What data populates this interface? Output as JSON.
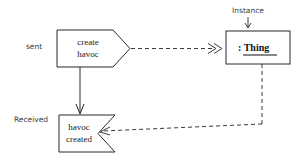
{
  "diagram": {
    "background_color": "#ffffff",
    "line_color": "#2b2b2b",
    "dashed_line_color": "#3a3a3a",
    "annotation_color": "#3a3a3a"
  },
  "nodes": {
    "send_signal": {
      "label_line1": "create",
      "label_line2": "havoc",
      "shape": "send-signal-pentagon"
    },
    "receive_signal": {
      "label_line1": "havoc",
      "label_line2": "created",
      "shape": "receive-signal-concave"
    },
    "object": {
      "label": ": Thing",
      "shape": "object-rectangle",
      "underlined": "true"
    }
  },
  "annotations": {
    "sent": "sent",
    "received": "Received",
    "instance": "Instance"
  },
  "edges": {
    "send_to_object": "dashed signal flow from create havoc to : Thing",
    "send_to_receive": "solid control flow from create havoc to havoc created",
    "object_to_receive": "dashed signal flow from : Thing to havoc created"
  }
}
